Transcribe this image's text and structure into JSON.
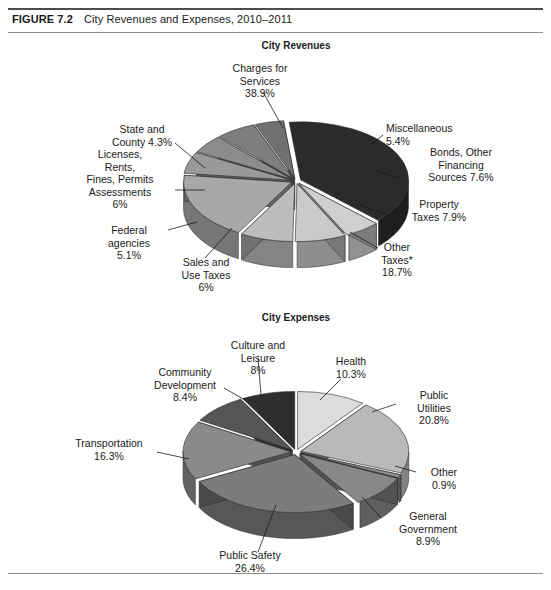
{
  "figure": {
    "number": "FIGURE 7.2",
    "title": "City Revenues and Expenses, 2010–2011"
  },
  "chart_data": [
    {
      "type": "pie",
      "title": "City Revenues",
      "style": "3d-exploded-grayscale",
      "labels": [
        "Charges for Services",
        "Miscellaneous",
        "Bonds, Other Financing Sources",
        "Property Taxes",
        "Other Taxes*",
        "Sales and Use Taxes",
        "Federal agencies",
        "Licenses, Rents, Fines, Permits Assessments",
        "State and County"
      ],
      "values": [
        38.9,
        5.4,
        7.6,
        7.9,
        18.7,
        6.0,
        5.1,
        6.0,
        4.3
      ],
      "value_strings": [
        "38.9%",
        "5.4%",
        "7.6%",
        "7.9%",
        "18.7%",
        "6%",
        "5.1%",
        "6%",
        "4.3%"
      ],
      "colors": [
        "#2b2b2b",
        "#cfcfcf",
        "#cacaca",
        "#bdbdbd",
        "#a8a8a8",
        "#9a9a9a",
        "#8c8c8c",
        "#7e7e7e",
        "#707070"
      ]
    },
    {
      "type": "pie",
      "title": "City Expenses",
      "style": "3d-exploded-grayscale",
      "labels": [
        "Health",
        "Public Utilities",
        "Other",
        "General Government",
        "Public Safety",
        "Transportation",
        "Community Development",
        "Culture and Leisure"
      ],
      "values": [
        10.3,
        20.8,
        0.9,
        8.9,
        26.4,
        16.3,
        8.4,
        8.0
      ],
      "value_strings": [
        "10.3%",
        "20.8%",
        "0.9%",
        "8.9%",
        "26.4%",
        "16.3%",
        "8.4%",
        "8%"
      ],
      "colors": [
        "#dcdcdc",
        "#b9b9b9",
        "#8f8f8f",
        "#888888",
        "#7c7c7c",
        "#8a8a8a",
        "#555555",
        "#2e2e2e"
      ]
    }
  ],
  "revenues_labels": {
    "charges": "Charges for\nServices\n38.9%",
    "misc": "Miscellaneous\n5.4%",
    "bonds": "Bonds, Other\nFinancing\nSources 7.6%",
    "property": "Property\nTaxes 7.9%",
    "othertax": "Other\nTaxes*\n18.7%",
    "sales": "Sales and\nUse Taxes\n6%",
    "federal": "Federal\nagencies\n5.1%",
    "licenses": "Licenses,\nRents,\nFines, Permits\nAssessments\n6%",
    "state": "State and\nCounty 4.3%"
  },
  "expenses_labels": {
    "culture": "Culture and\nLeisure\n8%",
    "health": "Health\n10.3%",
    "utilities": "Public\nUtilities\n20.8%",
    "other": "Other\n0.9%",
    "general": "General\nGovernment\n8.9%",
    "safety": "Public Safety\n26.4%",
    "transport": "Transportation\n16.3%",
    "community": "Community\nDevelopment\n8.4%"
  }
}
